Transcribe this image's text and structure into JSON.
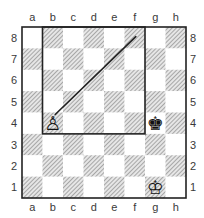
{
  "board": {
    "files": [
      "a",
      "b",
      "c",
      "d",
      "e",
      "f",
      "g",
      "h"
    ],
    "ranks": [
      "8",
      "7",
      "6",
      "5",
      "4",
      "3",
      "2",
      "1"
    ],
    "light_color": "#ffffff",
    "dark_pattern": "diagonal-hatch",
    "dark_color": "#9a9a9a",
    "border_color": "#222222"
  },
  "pieces": [
    {
      "square": "b4",
      "type": "pawn",
      "color": "white",
      "glyph": "♙"
    },
    {
      "square": "g4",
      "type": "king",
      "color": "black",
      "glyph": "♚"
    },
    {
      "square": "g1",
      "type": "king",
      "color": "white",
      "glyph": "♔"
    }
  ],
  "annotations": {
    "square_rule_box": {
      "from": "b8",
      "to": "f4"
    },
    "arrow_line": {
      "from": "b4",
      "to": "f8"
    }
  }
}
